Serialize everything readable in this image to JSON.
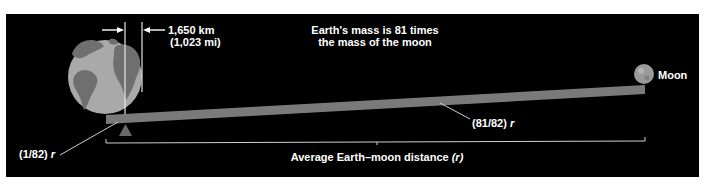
{
  "diagram": {
    "title_line1": "Earth's mass is 81 times",
    "title_line2": "the mass of the moon",
    "dimension_km": "1,650 km",
    "dimension_mi": "(1,023 mi)",
    "moon_label": "Moon",
    "earth_side_ratio": "(1/82)",
    "moon_side_ratio": "(81/82)",
    "ratio_variable": "r",
    "distance_label": "Average Earth–moon distance",
    "distance_variable": "(r)",
    "colors": {
      "background": "#000000",
      "earth_ocean": "#a9a9a9",
      "earth_land": "#6f6f6f",
      "beam": "#7a7a7a",
      "fulcrum": "#6a6a6a",
      "moon": "#9a9a9a",
      "lines": "#cfcfcf",
      "text": "#ffffff"
    }
  }
}
